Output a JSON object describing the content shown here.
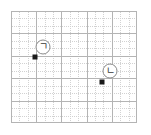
{
  "diagram": {
    "type": "coordinate-grid",
    "grid": {
      "major_columns": 5,
      "major_rows": 5,
      "minor_per_major": 3,
      "major_color": "#b4b4b4",
      "minor_color": "#d2d2d2",
      "minor_style": "dotted",
      "background": "#ffffff"
    },
    "points": [
      {
        "id": "point-a",
        "label": "ㄱ",
        "marker_color": "#1a1a1a",
        "x_px": 35,
        "y_px": 57,
        "grid_col": 1,
        "grid_row": 2,
        "label_x_px": 43,
        "label_y_px": 47
      },
      {
        "id": "point-b",
        "label": "ㄴ",
        "marker_color": "#1a1a1a",
        "x_px": 102,
        "y_px": 82,
        "grid_col": 3.6,
        "grid_row": 3.2,
        "label_x_px": 110,
        "label_y_px": 71
      }
    ]
  }
}
